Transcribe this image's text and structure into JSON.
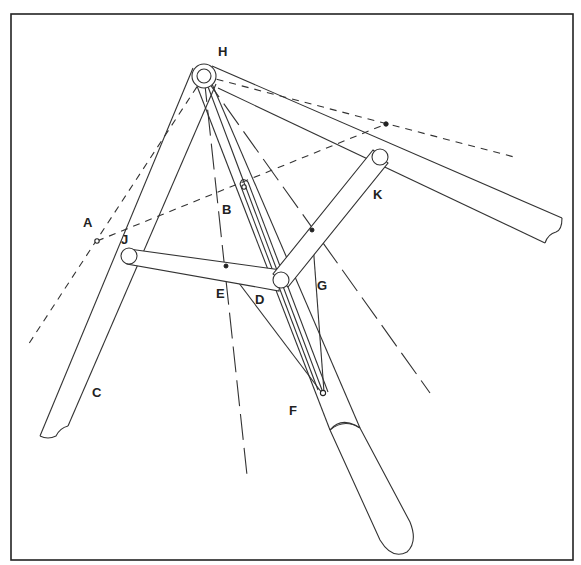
{
  "diagram": {
    "type": "mechanical linkage drawing",
    "labels": {
      "H": "H",
      "A": "A",
      "B": "B",
      "C": "C",
      "D": "D",
      "E": "E",
      "F": "F",
      "G": "G",
      "J": "J",
      "K": "K"
    },
    "label_positions": {
      "H": [
        224,
        51
      ],
      "A": [
        87,
        222
      ],
      "B": [
        226,
        210
      ],
      "C": [
        94,
        392
      ],
      "D": [
        255,
        303
      ],
      "E": [
        218,
        297
      ],
      "F": [
        292,
        412
      ],
      "G": [
        319,
        286
      ],
      "J": [
        122,
        243
      ],
      "K": [
        375,
        196
      ]
    },
    "colors": {
      "line": "#333333",
      "background": "#ffffff"
    }
  }
}
